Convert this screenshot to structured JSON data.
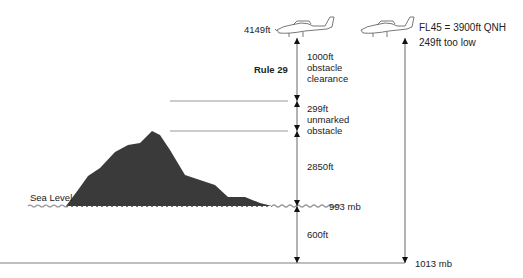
{
  "aircraft_left": {
    "altitude_label": "4149ft",
    "icon": "airplane-icon"
  },
  "aircraft_right": {
    "line1": "FL45 = 3900ft QNH",
    "line2": "249ft too low",
    "icon": "airplane-icon"
  },
  "rule_label": "Rule 29",
  "segments": [
    {
      "label_lines": [
        "1000ft",
        "obstacle",
        "clearance"
      ]
    },
    {
      "label_lines": [
        "299ft",
        "unmarked",
        "obstacle"
      ]
    },
    {
      "label_lines": [
        "2850ft"
      ]
    },
    {
      "label_lines": [
        "600ft"
      ]
    }
  ],
  "sea_level_label": "Sea Level",
  "pressure_levels": {
    "sea_level_mb": "993 mb",
    "standard_mb": "1013 mb"
  },
  "colors": {
    "terrain": "#3a3a3a",
    "lines": "#888888",
    "text": "#222222"
  }
}
